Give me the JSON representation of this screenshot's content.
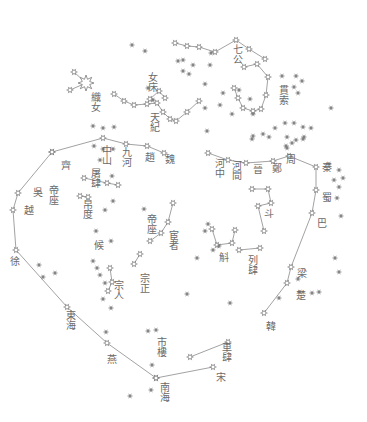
{
  "colors": {
    "ink": "#7a7a7a",
    "background": "#ffffff"
  },
  "labels": [
    {
      "text": "七公",
      "x": 231,
      "y": 44
    },
    {
      "text": "女床",
      "x": 146,
      "y": 72
    },
    {
      "text": "天紀",
      "x": 148,
      "y": 112
    },
    {
      "text": "織女",
      "x": 89,
      "y": 92
    },
    {
      "text": "貫索",
      "x": 277,
      "y": 85
    },
    {
      "text": "中山",
      "x": 100,
      "y": 145
    },
    {
      "text": "九河",
      "x": 120,
      "y": 147
    },
    {
      "text": "趙",
      "x": 143,
      "y": 152
    },
    {
      "text": "魏",
      "x": 163,
      "y": 154
    },
    {
      "text": "齊",
      "x": 59,
      "y": 160
    },
    {
      "text": "吳",
      "x": 31,
      "y": 187
    },
    {
      "text": "越",
      "x": 22,
      "y": 205
    },
    {
      "text": "帝座",
      "x": 47,
      "y": 185
    },
    {
      "text": "屠肆",
      "x": 89,
      "y": 168
    },
    {
      "text": "帛度",
      "x": 81,
      "y": 199
    },
    {
      "text": "候",
      "x": 92,
      "y": 240
    },
    {
      "text": "帝座",
      "x": 145,
      "y": 214
    },
    {
      "text": "宦者",
      "x": 167,
      "y": 230
    },
    {
      "text": "徐",
      "x": 8,
      "y": 256
    },
    {
      "text": "宗人",
      "x": 112,
      "y": 280
    },
    {
      "text": "宗正",
      "x": 138,
      "y": 273
    },
    {
      "text": "河中",
      "x": 213,
      "y": 158
    },
    {
      "text": "河間",
      "x": 230,
      "y": 160
    },
    {
      "text": "晉",
      "x": 251,
      "y": 164
    },
    {
      "text": "鄭",
      "x": 270,
      "y": 163
    },
    {
      "text": "周",
      "x": 284,
      "y": 154
    },
    {
      "text": "秦",
      "x": 320,
      "y": 162
    },
    {
      "text": "蜀",
      "x": 320,
      "y": 192
    },
    {
      "text": "巴",
      "x": 315,
      "y": 218
    },
    {
      "text": "斗",
      "x": 262,
      "y": 208
    },
    {
      "text": "斛",
      "x": 217,
      "y": 252
    },
    {
      "text": "列肆",
      "x": 246,
      "y": 255
    },
    {
      "text": "梁",
      "x": 295,
      "y": 268
    },
    {
      "text": "楚",
      "x": 294,
      "y": 290
    },
    {
      "text": "韓",
      "x": 264,
      "y": 321
    },
    {
      "text": "東海",
      "x": 64,
      "y": 310
    },
    {
      "text": "燕",
      "x": 105,
      "y": 354
    },
    {
      "text": "市樓",
      "x": 155,
      "y": 337
    },
    {
      "text": "南海",
      "x": 158,
      "y": 382
    },
    {
      "text": "車肆",
      "x": 220,
      "y": 342
    },
    {
      "text": "宋",
      "x": 214,
      "y": 372
    }
  ],
  "constellations": {
    "left_wall": [
      [
        52,
        152
      ],
      [
        18,
        193
      ],
      [
        13,
        210
      ],
      [
        16,
        250
      ],
      [
        67,
        307
      ],
      [
        107,
        343
      ],
      [
        156,
        378
      ]
    ],
    "left_wall_top": [
      [
        52,
        152
      ],
      [
        103,
        138
      ],
      [
        126,
        144
      ],
      [
        147,
        146
      ],
      [
        164,
        153
      ]
    ],
    "right_wall": [
      [
        208,
        153
      ],
      [
        228,
        160
      ],
      [
        246,
        163
      ],
      [
        273,
        161
      ],
      [
        289,
        156
      ],
      [
        316,
        167
      ],
      [
        316,
        190
      ],
      [
        312,
        213
      ],
      [
        291,
        267
      ],
      [
        287,
        283
      ],
      [
        264,
        313
      ]
    ],
    "south_link": [
      [
        156,
        378
      ],
      [
        213,
        367
      ]
    ],
    "che_si": [
      [
        190,
        357
      ],
      [
        228,
        342
      ]
    ],
    "qi_gong": [
      [
        175,
        43
      ],
      [
        187,
        46
      ],
      [
        199,
        47
      ],
      [
        215,
        52
      ],
      [
        236,
        40
      ],
      [
        249,
        49
      ],
      [
        265,
        59
      ]
    ],
    "guan_suo": [
      [
        244,
        67
      ],
      [
        257,
        64
      ],
      [
        268,
        77
      ],
      [
        266,
        95
      ],
      [
        261,
        109
      ],
      [
        253,
        111
      ],
      [
        243,
        108
      ],
      [
        238,
        98
      ],
      [
        234,
        88
      ]
    ],
    "tian_ji": [
      [
        114,
        94
      ],
      [
        124,
        101
      ],
      [
        134,
        105
      ],
      [
        147,
        104
      ],
      [
        157,
        103
      ],
      [
        163,
        112
      ],
      [
        170,
        119
      ],
      [
        176,
        121
      ],
      [
        187,
        112
      ],
      [
        199,
        101
      ]
    ],
    "nv_chuang": [
      [
        150,
        99
      ],
      [
        159,
        91
      ],
      [
        165,
        98
      ]
    ],
    "zhi_nv": [
      [
        74,
        72
      ],
      [
        86,
        83
      ],
      [
        70,
        90
      ]
    ],
    "dou": [
      [
        252,
        189
      ],
      [
        268,
        189
      ],
      [
        271,
        203
      ],
      [
        258,
        206
      ],
      [
        264,
        231
      ]
    ],
    "hu": [
      [
        212,
        229
      ],
      [
        217,
        245
      ],
      [
        232,
        243
      ],
      [
        235,
        230
      ]
    ],
    "lie_si": [
      [
        239,
        250
      ],
      [
        260,
        248
      ]
    ],
    "huan_zhe": [
      [
        173,
        203
      ],
      [
        168,
        222
      ],
      [
        161,
        233
      ],
      [
        150,
        241
      ]
    ],
    "tu_si": [
      [
        84,
        178
      ],
      [
        107,
        183
      ],
      [
        118,
        185
      ]
    ],
    "bo_du": [
      [
        80,
        196
      ],
      [
        88,
        197
      ]
    ],
    "zong_zheng": [
      [
        134,
        264
      ],
      [
        140,
        254
      ]
    ],
    "zong_ren": [
      [
        110,
        268
      ],
      [
        112,
        282
      ],
      [
        108,
        291
      ]
    ]
  },
  "stars": [
    [
      132,
      45
    ],
    [
      145,
      51
    ],
    [
      211,
      53
    ],
    [
      193,
      65
    ],
    [
      148,
      88
    ],
    [
      153,
      100
    ],
    [
      178,
      61
    ],
    [
      183,
      60
    ],
    [
      210,
      65
    ],
    [
      183,
      71
    ],
    [
      189,
      74
    ],
    [
      205,
      84
    ],
    [
      223,
      93
    ],
    [
      205,
      108
    ],
    [
      220,
      105
    ],
    [
      239,
      90
    ],
    [
      250,
      99
    ],
    [
      232,
      114
    ],
    [
      253,
      114
    ],
    [
      282,
      76
    ],
    [
      296,
      76
    ],
    [
      294,
      87
    ],
    [
      302,
      81
    ],
    [
      298,
      93
    ],
    [
      331,
      108
    ],
    [
      285,
      123
    ],
    [
      294,
      123
    ],
    [
      303,
      127
    ],
    [
      311,
      128
    ],
    [
      253,
      136
    ],
    [
      269,
      137
    ],
    [
      287,
      137
    ],
    [
      292,
      143
    ],
    [
      296,
      140
    ],
    [
      303,
      139
    ],
    [
      287,
      148
    ],
    [
      275,
      128
    ],
    [
      286,
      146
    ],
    [
      304,
      137
    ],
    [
      207,
      131
    ],
    [
      252,
      139
    ],
    [
      263,
      134
    ],
    [
      94,
      146
    ],
    [
      103,
      149
    ],
    [
      113,
      149
    ],
    [
      93,
      126
    ],
    [
      103,
      128
    ],
    [
      114,
      127
    ],
    [
      100,
      160
    ],
    [
      112,
      176
    ],
    [
      144,
      209
    ],
    [
      113,
      201
    ],
    [
      105,
      210
    ],
    [
      111,
      241
    ],
    [
      96,
      231
    ],
    [
      39,
      265
    ],
    [
      43,
      277
    ],
    [
      55,
      273
    ],
    [
      93,
      261
    ],
    [
      97,
      268
    ],
    [
      100,
      275
    ],
    [
      105,
      283
    ],
    [
      103,
      299
    ],
    [
      111,
      308
    ],
    [
      106,
      332
    ],
    [
      148,
      331
    ],
    [
      156,
      330
    ],
    [
      152,
      365
    ],
    [
      130,
      396
    ],
    [
      151,
      390
    ],
    [
      208,
      224
    ],
    [
      205,
      231
    ],
    [
      213,
      250
    ],
    [
      219,
      246
    ],
    [
      334,
      180
    ],
    [
      339,
      187
    ],
    [
      337,
      198
    ],
    [
      341,
      216
    ],
    [
      335,
      258
    ],
    [
      339,
      272
    ],
    [
      279,
      298
    ],
    [
      300,
      292
    ],
    [
      312,
      293
    ],
    [
      230,
      303
    ],
    [
      187,
      294
    ],
    [
      329,
      164
    ],
    [
      339,
      170
    ],
    [
      343,
      178
    ],
    [
      298,
      279
    ],
    [
      319,
      292
    ],
    [
      197,
      258
    ]
  ]
}
